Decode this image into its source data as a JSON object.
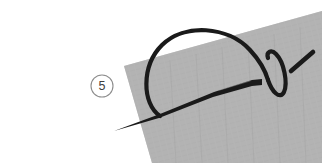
{
  "illustration": {
    "title": "Blanket stitch step diagram",
    "type": "sewing-instruction-diagram",
    "canvas": {
      "width": 322,
      "height": 163
    },
    "background_color": "#ffffff"
  },
  "step_marker": {
    "label": "5",
    "shape": "circle-outline",
    "center": {
      "x": 102,
      "y": 86
    },
    "radius": 11,
    "stroke_color": "#8c8c8c",
    "text_color": "#3f3f3f"
  },
  "fabric": {
    "name": "fabric-piece",
    "fill_color": "#b3b3b3",
    "texture": "subtle woven grain",
    "corners": [
      {
        "x": 124,
        "y": 66
      },
      {
        "x": 322,
        "y": 11
      },
      {
        "x": 322,
        "y": 163
      },
      {
        "x": 152,
        "y": 163
      }
    ]
  },
  "needle": {
    "name": "sewing-needle",
    "color": "#1a1a1a",
    "description": "tapered needle entering fabric from lower left, emerging upper right",
    "tip_point": {
      "x": 114,
      "y": 130
    },
    "body_end": {
      "x": 262,
      "y": 80
    },
    "detached_tip": {
      "from": {
        "x": 291,
        "y": 70
      },
      "to": {
        "x": 313,
        "y": 52
      }
    },
    "max_thickness_px": 7
  },
  "thread": {
    "name": "thread",
    "color": "#1a1a1a",
    "stroke_width": 4,
    "arc_description": "large loop of thread arching up and over the fabric edge",
    "loop_description": "small vertical thread loop wrapping around the needle at right"
  },
  "colors": {
    "background": "#ffffff",
    "fabric": "#b3b3b3",
    "fabric_shade": "#a9a9a9",
    "ink": "#1a1a1a",
    "marker_stroke": "#8c8c8c",
    "marker_text": "#3f3f3f"
  }
}
